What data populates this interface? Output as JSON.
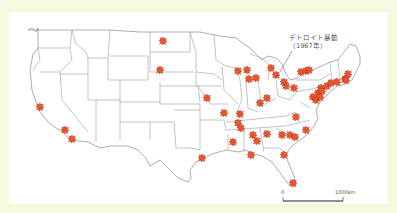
{
  "map": {
    "title": "",
    "region": "Contiguous United States",
    "annotation": {
      "line1": "デトロイト暴動",
      "line2": "（1967年）",
      "target": "Detroit"
    },
    "scale_bar": {
      "start_label": "0",
      "end_label": "1000km"
    },
    "colors": {
      "background_frame": "#f5fadf",
      "panel": "#ffffff",
      "state_lines": "#9a9a9a",
      "marker_fill": "#e8542c",
      "marker_stroke": "#b5361a"
    },
    "marker_icon": "starburst-icon",
    "markers": [
      {
        "id": "north-dakota",
        "x": 163,
        "y": 41
      },
      {
        "id": "south-dakota",
        "x": 160,
        "y": 70
      },
      {
        "id": "kansas-city",
        "x": 207,
        "y": 98
      },
      {
        "id": "northern-california",
        "x": 40,
        "y": 107
      },
      {
        "id": "los-angeles",
        "x": 65,
        "y": 130
      },
      {
        "id": "san-diego",
        "x": 72,
        "y": 139
      },
      {
        "id": "minneapolis",
        "x": 238,
        "y": 71
      },
      {
        "id": "milwaukee",
        "x": 247,
        "y": 70
      },
      {
        "id": "chicago-1",
        "x": 249,
        "y": 79
      },
      {
        "id": "chicago-2",
        "x": 256,
        "y": 78
      },
      {
        "id": "grand-rapids",
        "x": 271,
        "y": 68
      },
      {
        "id": "detroit",
        "x": 276,
        "y": 75
      },
      {
        "id": "toledo",
        "x": 284,
        "y": 82
      },
      {
        "id": "cleveland",
        "x": 286,
        "y": 86
      },
      {
        "id": "buffalo-1",
        "x": 301,
        "y": 72
      },
      {
        "id": "buffalo-2",
        "x": 306,
        "y": 71
      },
      {
        "id": "rochester",
        "x": 309,
        "y": 70
      },
      {
        "id": "pittsburgh",
        "x": 294,
        "y": 88
      },
      {
        "id": "cincinnati",
        "x": 267,
        "y": 98
      },
      {
        "id": "indianapolis",
        "x": 260,
        "y": 103
      },
      {
        "id": "st-louis",
        "x": 240,
        "y": 114
      },
      {
        "id": "newark",
        "x": 321,
        "y": 88
      },
      {
        "id": "new-york",
        "x": 327,
        "y": 86
      },
      {
        "id": "new-haven",
        "x": 331,
        "y": 83
      },
      {
        "id": "hartford",
        "x": 337,
        "y": 82
      },
      {
        "id": "providence",
        "x": 345,
        "y": 79
      },
      {
        "id": "boston",
        "x": 348,
        "y": 74
      },
      {
        "id": "boston-2",
        "x": 346,
        "y": 80
      },
      {
        "id": "philadelphia",
        "x": 318,
        "y": 93
      },
      {
        "id": "trenton",
        "x": 322,
        "y": 91
      },
      {
        "id": "baltimore",
        "x": 313,
        "y": 97
      },
      {
        "id": "washington",
        "x": 316,
        "y": 100
      },
      {
        "id": "wilmington",
        "x": 320,
        "y": 97
      },
      {
        "id": "richmond",
        "x": 296,
        "y": 117
      },
      {
        "id": "norfolk",
        "x": 306,
        "y": 130
      },
      {
        "id": "memphis",
        "x": 238,
        "y": 123
      },
      {
        "id": "memphis-2",
        "x": 241,
        "y": 128
      },
      {
        "id": "jackson",
        "x": 233,
        "y": 142
      },
      {
        "id": "birmingham",
        "x": 253,
        "y": 135
      },
      {
        "id": "montgomery",
        "x": 257,
        "y": 141
      },
      {
        "id": "atlanta",
        "x": 267,
        "y": 134
      },
      {
        "id": "greenville",
        "x": 282,
        "y": 135
      },
      {
        "id": "charlotte",
        "x": 290,
        "y": 135
      },
      {
        "id": "columbia",
        "x": 295,
        "y": 137
      },
      {
        "id": "raleigh",
        "x": 307,
        "y": 130
      },
      {
        "id": "tallahassee",
        "x": 251,
        "y": 155
      },
      {
        "id": "jacksonville",
        "x": 284,
        "y": 155
      },
      {
        "id": "houston",
        "x": 202,
        "y": 158
      },
      {
        "id": "miami",
        "x": 293,
        "y": 183
      },
      {
        "id": "cairo",
        "x": 224,
        "y": 113
      }
    ]
  }
}
